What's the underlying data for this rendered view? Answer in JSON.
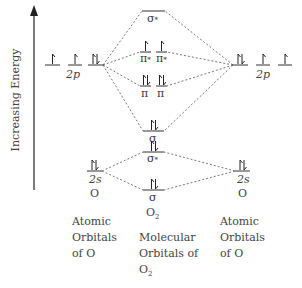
{
  "axis": {
    "label": "Increasing Energy"
  },
  "left_atom": {
    "p_label": "2p",
    "s_label": "2s",
    "element": "O",
    "p_electrons": [
      1,
      1,
      2
    ],
    "s_electrons": 2
  },
  "right_atom": {
    "p_label": "2p",
    "s_label": "2s",
    "element": "O",
    "p_electrons": [
      2,
      1,
      1
    ],
    "s_electrons": 2
  },
  "molecular_orbitals": {
    "sigma_star_2p": {
      "symbol": "σ",
      "star": "*",
      "electrons": 0
    },
    "pi_star_2p": [
      {
        "symbol": "π",
        "star": "*",
        "electrons": 1
      },
      {
        "symbol": "π",
        "star": "*",
        "electrons": 1
      }
    ],
    "pi_2p": [
      {
        "symbol": "π",
        "electrons": 2
      },
      {
        "symbol": "π",
        "electrons": 2
      }
    ],
    "sigma_2p": {
      "symbol": "σ",
      "electrons": 2
    },
    "sigma_star_2s": {
      "symbol": "σ",
      "star": "*",
      "electrons": 2
    },
    "sigma_2s": {
      "symbol": "σ",
      "electrons": 2
    },
    "molecule": "O",
    "molecule_sub": "2"
  },
  "captions": {
    "left": [
      "Atomic",
      "Orbitals",
      "of O"
    ],
    "middle": [
      "Molecular",
      "Orbitals of",
      "O"
    ],
    "middle_sub": "2",
    "right": [
      "Atomic",
      "Orbitals",
      "of O"
    ]
  }
}
